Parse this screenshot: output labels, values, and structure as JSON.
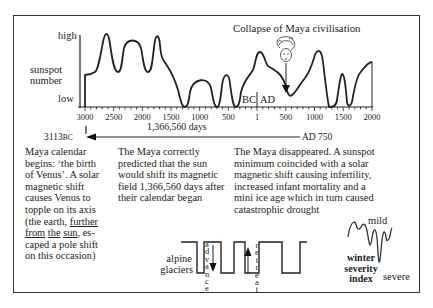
{
  "figure": {
    "top_caption_fragment": "Figure ... Maya ... sunspot ...",
    "annotation_collapse": "Collapse of Maya civilisation",
    "y_axis": {
      "label_line1": "sunspot",
      "label_line2": "number",
      "high": "high",
      "low": "low"
    },
    "era_labels": {
      "bc": "BC",
      "ad": "AD"
    },
    "span": {
      "start_label": "3113",
      "start_suffix": "BC",
      "end_label": "AD 750",
      "days": "1,366,560 days"
    },
    "captions": {
      "calendar": {
        "lines": [
          "Maya calendar",
          "begins: ‘the birth",
          "of Venus’. A solar",
          "magnetic shift",
          "causes Venus to",
          "topple on its axis",
          "(the earth, ",
          "further",
          " ",
          "from",
          " ",
          "the",
          " ",
          "sun",
          ", es-",
          "caped a pole shift",
          "on  this occasion)"
        ],
        "l1": "Maya calendar",
        "l2": "begins: ‘the birth",
        "l3": "of Venus’. A solar",
        "l4": "magnetic shift",
        "l5": "causes Venus to",
        "l6": "topple on its axis",
        "l7a": "(the earth, ",
        "l7b": "further",
        "l8a": "from",
        "l8b": "the",
        "l8c": "sun",
        "l8d": ", es-",
        "l9": "caped a pole shift",
        "l10": "on  this occasion)"
      },
      "prediction": {
        "l1": "The Maya correctly",
        "l2": "predicted that the sun",
        "l3": "would shift its magnetic",
        "l4": "field 1,366,560 days after",
        "l5": "their calendar began"
      },
      "disappearance": {
        "l1": "The Maya disappeared. A sunspot",
        "l2": "minimum coincided with a solar",
        "l3": "magnetic shift causing infertility,",
        "l4": "increased infant mortality and a",
        "l5": "mini ice age which in turn caused",
        "l6": "catastrophic drought"
      }
    },
    "glaciers": {
      "label_line1": "alpine",
      "label_line2": "glaciers",
      "advance": "advance",
      "retreat": "retreat"
    },
    "winter": {
      "mild": "mild",
      "severe": "severe",
      "label_line1": "winter",
      "label_line2": "severity",
      "label_line3": "index"
    }
  },
  "chart_data": {
    "type": "line",
    "title": "Collapse of Maya civilisation",
    "xlabel": "",
    "ylabel": "sunspot number",
    "x_tick_labels": [
      "3000",
      "2500",
      "2000",
      "1500",
      "1000",
      "500",
      "1",
      "500",
      "1000",
      "1500",
      "2000"
    ],
    "x_ticks_signed_years": [
      -3000,
      -2500,
      -2000,
      -1500,
      -1000,
      -500,
      1,
      500,
      1000,
      1500,
      2000
    ],
    "y_tick_labels": [
      "low",
      "high"
    ],
    "ylim": [
      0,
      1
    ],
    "grid": false,
    "legend": null,
    "series": [
      {
        "name": "sunspot number (relative)",
        "x": [
          -3000,
          -2900,
          -2800,
          -2700,
          -2650,
          -2550,
          -2450,
          -2350,
          -2200,
          -2050,
          -1950,
          -1850,
          -1800,
          -1700,
          -1600,
          -1450,
          -1350,
          -1300,
          -1200,
          -1050,
          -900,
          -800,
          -750,
          -650,
          -520,
          -400,
          -320,
          -200,
          -100,
          0,
          100,
          250,
          500,
          650,
          700,
          800,
          1000,
          1200,
          1300,
          1450,
          1550,
          1600,
          1700,
          1800,
          1900,
          2000
        ],
        "values": [
          0.45,
          0.47,
          0.52,
          0.85,
          0.95,
          0.55,
          0.55,
          0.82,
          0.85,
          0.55,
          0.55,
          0.97,
          0.92,
          0.6,
          0.45,
          0.22,
          0.0,
          0.0,
          0.45,
          0.55,
          0.45,
          0.05,
          0.0,
          0.0,
          0.7,
          0.0,
          0.0,
          0.55,
          0.7,
          0.9,
          0.75,
          0.55,
          0.4,
          0.25,
          0.2,
          0.35,
          0.6,
          0.92,
          0.55,
          0.0,
          0.0,
          0.6,
          0.0,
          0.55,
          0.78,
          0.85
        ]
      }
    ],
    "annotations": [
      {
        "text": "Collapse of Maya civilisation",
        "x": 700,
        "arrow_to": "minimum near AD 700"
      },
      {
        "text": "3113BC ← 1,366,560 days → AD 750",
        "type": "span"
      },
      {
        "text": "BC | AD",
        "x": 1
      }
    ],
    "sub_charts": [
      {
        "name": "alpine glaciers",
        "type": "square-wave",
        "labels": [
          "advance",
          "retreat"
        ]
      },
      {
        "name": "winter severity index",
        "type": "line",
        "labels": [
          "mild",
          "severe"
        ]
      }
    ]
  }
}
